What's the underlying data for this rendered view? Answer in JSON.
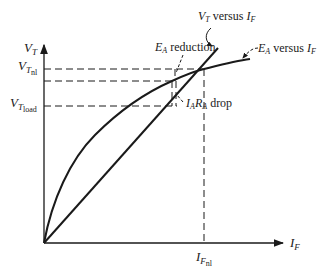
{
  "diagram": {
    "y_axis": {
      "symbol": "V",
      "sub": "T"
    },
    "x_axis": {
      "symbol": "I",
      "sub": "F"
    },
    "y_ticks": [
      {
        "symbol": "V",
        "sub": "T",
        "subsub": "nl"
      },
      {
        "symbol": "V",
        "sub": "T",
        "subsub": "load"
      }
    ],
    "x_ticks": [
      {
        "symbol": "I",
        "sub": "F",
        "subsub": "nl"
      }
    ],
    "annotations": {
      "vt_curve": {
        "sym": "V",
        "sub": "T",
        "text": " versus ",
        "sym2": "I",
        "sub2": "F"
      },
      "ea_curve": {
        "sym": "E",
        "sub": "A",
        "text": " versus ",
        "sym2": "I",
        "sub2": "F"
      },
      "ea_reduction": {
        "sym": "E",
        "sub": "A",
        "text": " reduction"
      },
      "iara_drop": {
        "sym1": "I",
        "sub1": "A",
        "sym2": "R",
        "sub2": "A",
        "text": " drop"
      }
    },
    "colors": {
      "ink": "#1a1a1a",
      "background": "#ffffff"
    }
  }
}
